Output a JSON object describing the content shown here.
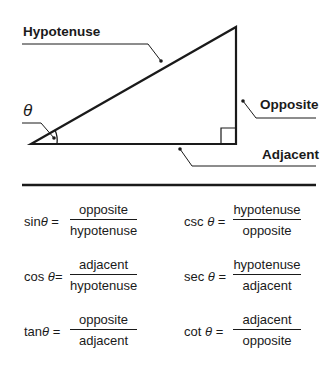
{
  "diagram": {
    "labels": {
      "hypotenuse": "Hypotenuse",
      "opposite": "Opposite",
      "adjacent": "Adjacent",
      "angle": "θ"
    },
    "colors": {
      "stroke": "#1a1a1a",
      "background": "#ffffff"
    }
  },
  "formulas": [
    {
      "fn": "sin",
      "theta": "θ",
      "eq": "=",
      "numerator": "opposite",
      "denominator": "hypotenuse"
    },
    {
      "fn": "csc",
      "theta": "θ",
      "eq": "=",
      "numerator": "hypotenuse",
      "denominator": "opposite"
    },
    {
      "fn": "cos",
      "theta": "θ",
      "eq": "=",
      "numerator": "adjacent",
      "denominator": "hypotenuse"
    },
    {
      "fn": "sec",
      "theta": "θ",
      "eq": "=",
      "numerator": "hypotenuse",
      "denominator": "adjacent"
    },
    {
      "fn": "tan",
      "theta": "θ",
      "eq": "=",
      "numerator": "opposite",
      "denominator": "adjacent"
    },
    {
      "fn": "cot",
      "theta": "θ",
      "eq": "=",
      "numerator": "adjacent",
      "denominator": "opposite"
    }
  ]
}
